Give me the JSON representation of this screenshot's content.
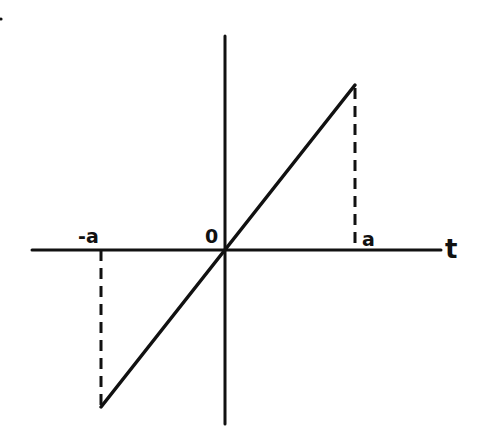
{
  "figure": {
    "type": "piecewise-linear function graph",
    "colors": {
      "ink": "#111111",
      "background": "#ffffff"
    }
  },
  "axes": {
    "horizontal_label": "t",
    "vertical_label": "",
    "origin_label": "0"
  },
  "ticks": {
    "left": "-a",
    "right": "a"
  },
  "stray_mark": "."
}
